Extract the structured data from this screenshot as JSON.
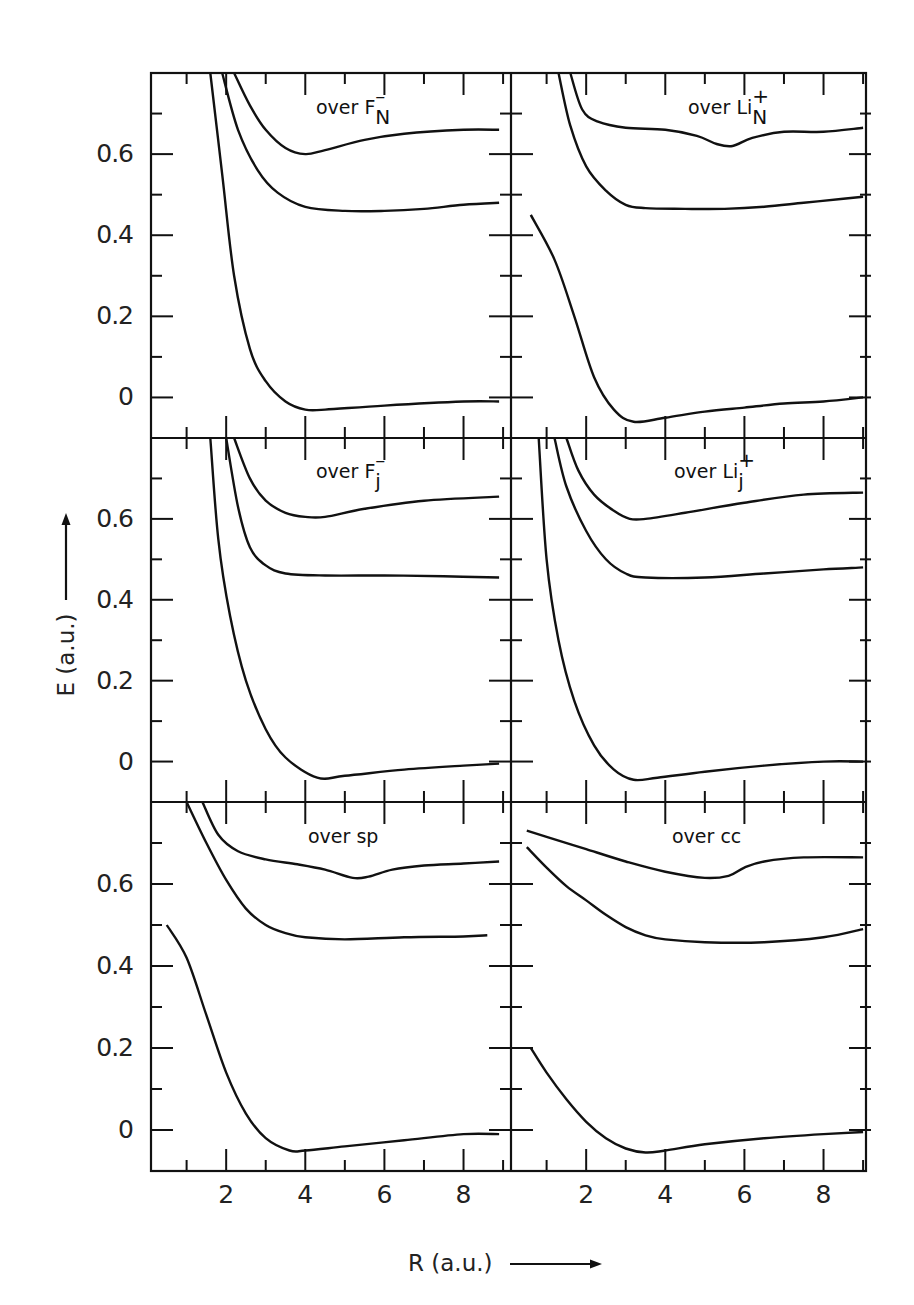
{
  "figure": {
    "y_axis_title": "E (a.u.)",
    "x_axis_title": "R (a.u.)",
    "y_tick_labels": [
      "0.6",
      "0.4",
      "0.2",
      "0"
    ],
    "x_tick_labels": [
      "2",
      "4",
      "6",
      "8"
    ],
    "line_color": "#111111",
    "background": "#ffffff"
  },
  "panels": [
    {
      "id": "p1",
      "title_prefix": "over",
      "symbol": "F",
      "sup": "–",
      "sub": "N"
    },
    {
      "id": "p2",
      "title_prefix": "over",
      "symbol": "Li",
      "sup": "+",
      "sub": "N"
    },
    {
      "id": "p3",
      "title_prefix": "over",
      "symbol": "F",
      "sup": "–",
      "sub": "j"
    },
    {
      "id": "p4",
      "title_prefix": "over",
      "symbol": "Li",
      "sup": "+",
      "sub": "j"
    },
    {
      "id": "p5",
      "title_prefix": "over",
      "symbol": "sp",
      "sup": "",
      "sub": ""
    },
    {
      "id": "p6",
      "title_prefix": "over",
      "symbol": "cc",
      "sup": "",
      "sub": ""
    }
  ],
  "chart_data": {
    "type": "line",
    "layout": "3x2 grid of panels sharing axes",
    "xlabel": "R (a.u.)",
    "ylabel": "E (a.u.)",
    "xlim": [
      0.1,
      9.2
    ],
    "ylim": [
      -0.1,
      0.8
    ],
    "x_ticks": [
      2,
      4,
      6,
      8
    ],
    "y_ticks": [
      0,
      0.2,
      0.4,
      0.6
    ],
    "grid": false,
    "legend": "none (panel titles)",
    "panels": [
      {
        "title": "over F⁻_N",
        "series": [
          {
            "name": "ground",
            "x": [
              1.6,
              1.9,
              2.2,
              2.6,
              3.0,
              3.5,
              4.0,
              4.5,
              6.0,
              8.0,
              8.9
            ],
            "y": [
              0.8,
              0.55,
              0.3,
              0.12,
              0.04,
              -0.01,
              -0.03,
              -0.03,
              -0.02,
              -0.01,
              -0.01
            ]
          },
          {
            "name": "excited-1",
            "x": [
              1.9,
              2.3,
              2.8,
              3.3,
              4.0,
              5.0,
              6.0,
              7.0,
              8.0,
              8.9
            ],
            "y": [
              0.8,
              0.66,
              0.56,
              0.505,
              0.47,
              0.46,
              0.46,
              0.465,
              0.475,
              0.48
            ]
          },
          {
            "name": "excited-2",
            "x": [
              2.2,
              2.6,
              3.0,
              3.5,
              4.0,
              4.5,
              5.5,
              6.5,
              8.0,
              8.9
            ],
            "y": [
              0.8,
              0.72,
              0.66,
              0.615,
              0.6,
              0.61,
              0.635,
              0.65,
              0.66,
              0.66
            ]
          }
        ]
      },
      {
        "title": "over Li⁺_N",
        "series": [
          {
            "name": "ground",
            "x": [
              0.6,
              1.2,
              1.7,
              2.2,
              2.7,
              3.2,
              4.0,
              5.0,
              6.0,
              7.0,
              8.0,
              9.0
            ],
            "y": [
              0.45,
              0.34,
              0.2,
              0.05,
              -0.03,
              -0.06,
              -0.05,
              -0.035,
              -0.025,
              -0.015,
              -0.01,
              0.0
            ]
          },
          {
            "name": "excited-1",
            "x": [
              1.3,
              1.6,
              2.0,
              2.5,
              3.0,
              3.5,
              4.5,
              5.5,
              6.5,
              7.5,
              8.5,
              9.0
            ],
            "y": [
              0.8,
              0.67,
              0.57,
              0.51,
              0.475,
              0.467,
              0.465,
              0.465,
              0.47,
              0.48,
              0.49,
              0.495
            ]
          },
          {
            "name": "excited-2",
            "x": [
              1.6,
              1.9,
              2.3,
              3.0,
              4.0,
              4.8,
              5.3,
              5.7,
              6.2,
              7.0,
              8.0,
              9.0
            ],
            "y": [
              0.8,
              0.71,
              0.68,
              0.665,
              0.66,
              0.645,
              0.625,
              0.62,
              0.64,
              0.655,
              0.655,
              0.665
            ]
          }
        ]
      },
      {
        "title": "over F⁻_j",
        "series": [
          {
            "name": "ground",
            "x": [
              1.6,
              1.8,
              2.1,
              2.5,
              3.0,
              3.5,
              4.3,
              5.0,
              6.5,
              8.0,
              8.9
            ],
            "y": [
              0.8,
              0.55,
              0.36,
              0.2,
              0.08,
              0.01,
              -0.04,
              -0.035,
              -0.02,
              -0.01,
              -0.005
            ]
          },
          {
            "name": "excited-1",
            "x": [
              2.0,
              2.3,
              2.6,
              3.0,
              3.5,
              4.5,
              6.0,
              7.5,
              8.9
            ],
            "y": [
              0.8,
              0.63,
              0.53,
              0.485,
              0.465,
              0.46,
              0.46,
              0.458,
              0.455
            ]
          },
          {
            "name": "excited-2",
            "x": [
              2.2,
              2.6,
              3.0,
              3.5,
              4.0,
              4.5,
              5.5,
              7.0,
              8.9
            ],
            "y": [
              0.8,
              0.7,
              0.645,
              0.615,
              0.605,
              0.605,
              0.625,
              0.645,
              0.655
            ]
          }
        ]
      },
      {
        "title": "over Li⁺_j",
        "series": [
          {
            "name": "ground",
            "x": [
              0.8,
              1.0,
              1.3,
              1.7,
              2.2,
              2.7,
              3.2,
              3.8,
              5.0,
              6.5,
              8.0,
              9.0
            ],
            "y": [
              0.8,
              0.5,
              0.3,
              0.15,
              0.04,
              -0.02,
              -0.045,
              -0.04,
              -0.025,
              -0.01,
              0.0,
              0.0
            ]
          },
          {
            "name": "excited-1",
            "x": [
              1.2,
              1.5,
              2.0,
              2.5,
              3.0,
              3.5,
              5.0,
              6.5,
              8.0,
              9.0
            ],
            "y": [
              0.8,
              0.68,
              0.57,
              0.5,
              0.465,
              0.455,
              0.455,
              0.465,
              0.475,
              0.48
            ]
          },
          {
            "name": "excited-2",
            "x": [
              1.5,
              1.8,
              2.2,
              2.7,
              3.1,
              3.5,
              4.5,
              6.0,
              7.5,
              9.0
            ],
            "y": [
              0.8,
              0.72,
              0.66,
              0.62,
              0.6,
              0.6,
              0.615,
              0.64,
              0.66,
              0.665
            ]
          }
        ]
      },
      {
        "title": "over sp",
        "series": [
          {
            "name": "ground",
            "x": [
              0.5,
              1.0,
              1.5,
              2.0,
              2.5,
              3.0,
              3.6,
              4.0,
              5.0,
              6.5,
              8.0,
              8.9
            ],
            "y": [
              0.5,
              0.42,
              0.28,
              0.14,
              0.04,
              -0.02,
              -0.05,
              -0.05,
              -0.04,
              -0.025,
              -0.01,
              -0.01
            ]
          },
          {
            "name": "excited-1",
            "x": [
              1.0,
              1.5,
              2.0,
              2.5,
              3.0,
              3.5,
              4.0,
              5.0,
              6.5,
              8.0,
              8.6
            ],
            "y": [
              0.8,
              0.7,
              0.61,
              0.54,
              0.5,
              0.48,
              0.47,
              0.465,
              0.47,
              0.472,
              0.475
            ]
          },
          {
            "name": "excited-2",
            "x": [
              1.4,
              1.8,
              2.3,
              3.0,
              3.8,
              4.5,
              5.2,
              5.6,
              6.2,
              7.0,
              8.0,
              8.9
            ],
            "y": [
              0.8,
              0.72,
              0.68,
              0.66,
              0.648,
              0.635,
              0.615,
              0.618,
              0.635,
              0.645,
              0.65,
              0.655
            ]
          }
        ]
      },
      {
        "title": "over cc",
        "series": [
          {
            "name": "ground",
            "x": [
              0.6,
              1.0,
              1.5,
              2.0,
              2.5,
              3.0,
              3.5,
              4.0,
              5.0,
              6.5,
              8.0,
              9.0
            ],
            "y": [
              0.2,
              0.14,
              0.075,
              0.02,
              -0.02,
              -0.045,
              -0.055,
              -0.05,
              -0.035,
              -0.02,
              -0.01,
              -0.005
            ]
          },
          {
            "name": "excited-1",
            "x": [
              0.5,
              1.0,
              1.5,
              2.0,
              2.5,
              3.0,
              3.5,
              4.0,
              5.0,
              6.5,
              8.0,
              9.0
            ],
            "y": [
              0.69,
              0.64,
              0.595,
              0.56,
              0.525,
              0.495,
              0.475,
              0.465,
              0.458,
              0.458,
              0.47,
              0.49
            ]
          },
          {
            "name": "excited-2",
            "x": [
              0.5,
              1.0,
              2.0,
              3.0,
              4.0,
              5.0,
              5.6,
              6.0,
              6.5,
              7.5,
              9.0
            ],
            "y": [
              0.73,
              0.715,
              0.685,
              0.655,
              0.63,
              0.615,
              0.62,
              0.64,
              0.655,
              0.665,
              0.665
            ]
          }
        ]
      }
    ]
  }
}
